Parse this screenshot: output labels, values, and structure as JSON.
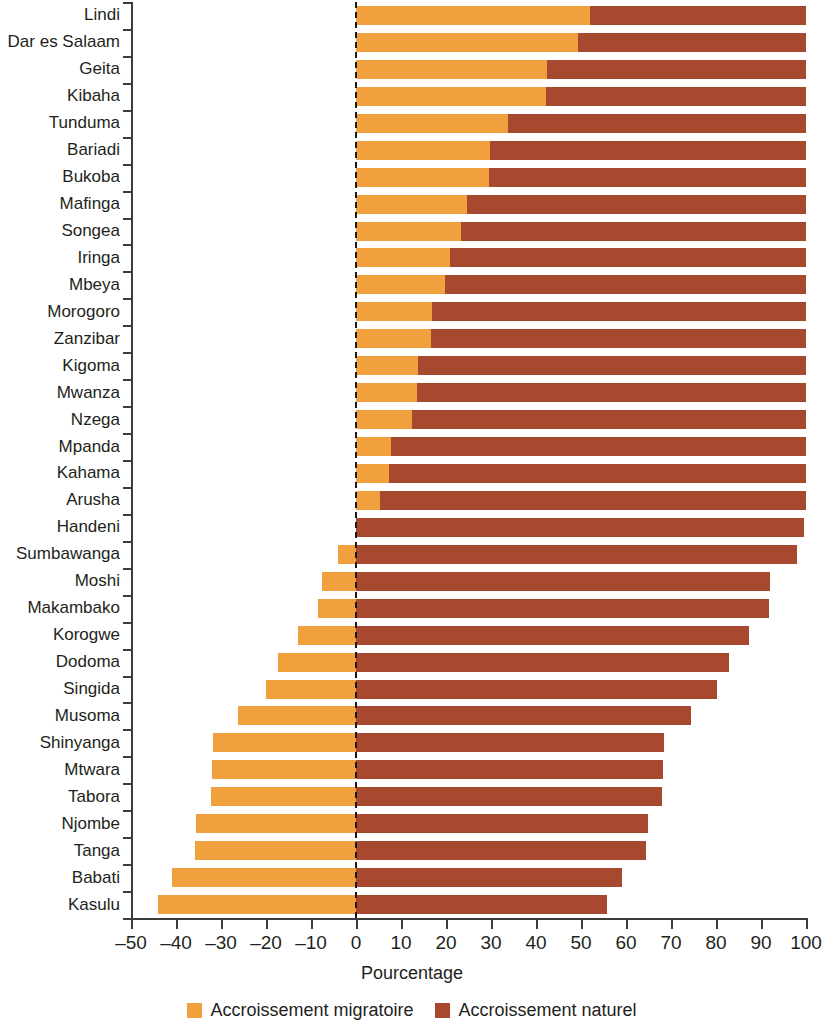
{
  "chart_data": {
    "type": "bar",
    "orientation": "horizontal",
    "stacked": true,
    "title": "",
    "xlabel": "Pourcentage",
    "ylabel": "",
    "xlim": [
      -50,
      100
    ],
    "xticks": [
      -50,
      -40,
      -30,
      -20,
      -10,
      0,
      10,
      20,
      30,
      40,
      50,
      60,
      70,
      80,
      90,
      100
    ],
    "xtick_labels": [
      "–50",
      "–40",
      "–30",
      "–20",
      "–10",
      "0",
      "10",
      "20",
      "30",
      "40",
      "50",
      "60",
      "70",
      "80",
      "90",
      "100"
    ],
    "grid": false,
    "zero_reference_line": true,
    "legend_position": "bottom",
    "colors": {
      "accroissement_migratoire": "#f0a03c",
      "accroissement_naturel": "#a8492f",
      "axis": "#3c3c3b",
      "text": "#231f20",
      "background": "#ffffff"
    },
    "categories": [
      "Lindi",
      "Dar es Salaam",
      "Geita",
      "Kibaha",
      "Tunduma",
      "Bariadi",
      "Bukoba",
      "Mafinga",
      "Songea",
      "Iringa",
      "Mbeya",
      "Morogoro",
      "Zanzibar",
      "Kigoma",
      "Mwanza",
      "Nzega",
      "Mpanda",
      "Kahama",
      "Arusha",
      "Handeni",
      "Sumbawanga",
      "Moshi",
      "Makambako",
      "Korogwe",
      "Dodoma",
      "Singida",
      "Musoma",
      "Shinyanga",
      "Mtwara",
      "Tabora",
      "Njombe",
      "Tanga",
      "Babati",
      "Kasulu"
    ],
    "series": [
      {
        "name": "Accroissement migratoire",
        "color": "#f0a03c",
        "values": [
          52.0,
          49.3,
          42.4,
          42.2,
          33.8,
          29.8,
          29.6,
          24.7,
          23.3,
          20.9,
          19.8,
          16.9,
          16.7,
          13.8,
          13.6,
          12.4,
          7.8,
          7.3,
          5.3,
          0.0,
          -4.0,
          -7.6,
          -8.4,
          -12.9,
          -17.3,
          -20.0,
          -26.2,
          -31.8,
          -32.0,
          -32.2,
          -35.6,
          -35.8,
          -40.9,
          -44.0
        ]
      },
      {
        "name": "Accroissement naturel",
        "color": "#a8492f",
        "values": [
          48.0,
          50.7,
          57.6,
          57.8,
          66.2,
          70.2,
          70.4,
          75.3,
          76.7,
          79.1,
          80.2,
          83.1,
          83.3,
          86.2,
          86.4,
          87.6,
          92.2,
          92.7,
          94.7,
          99.6,
          98.0,
          92.0,
          91.8,
          87.4,
          82.8,
          80.2,
          74.4,
          68.5,
          68.2,
          68.0,
          64.8,
          64.5,
          59.0,
          55.8
        ]
      }
    ],
    "bar_right_end": [
      100.0,
      100.0,
      100.0,
      100.0,
      100.0,
      100.0,
      100.0,
      100.0,
      100.0,
      100.0,
      100.0,
      100.0,
      100.0,
      100.0,
      100.0,
      100.0,
      100.0,
      100.0,
      100.0,
      99.6,
      98.0,
      92.0,
      91.8,
      87.4,
      82.8,
      80.2,
      74.4,
      68.5,
      68.2,
      68.0,
      64.8,
      64.5,
      59.0,
      55.8
    ]
  },
  "legend": {
    "items": [
      {
        "label": "Accroissement migratoire",
        "color": "#f0a03c"
      },
      {
        "label": "Accroissement naturel",
        "color": "#a8492f"
      }
    ]
  },
  "axis": {
    "x_title": "Pourcentage"
  }
}
